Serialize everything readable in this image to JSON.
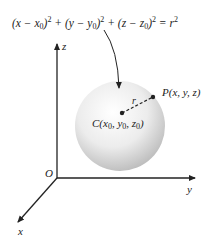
{
  "diagram": {
    "equation": {
      "parts": [
        "(x − x",
        "0",
        ")",
        "2",
        " + (y − y",
        "0",
        ")",
        "2",
        " + (z − z",
        "0",
        ")",
        "2",
        " = r",
        "2"
      ]
    },
    "axes": {
      "z_label": "z",
      "y_label": "y",
      "x_label": "x",
      "origin_label": "O"
    },
    "sphere": {
      "center_label_parts": [
        "C(x",
        "0",
        ", y",
        "0",
        ", z",
        "0",
        ")"
      ],
      "point_label": "P(x, y, z)",
      "radius_label": "r"
    },
    "colors": {
      "ink": "#222222",
      "sphere_light": "#ffffff",
      "sphere_dark": "#bdbdbd"
    }
  }
}
